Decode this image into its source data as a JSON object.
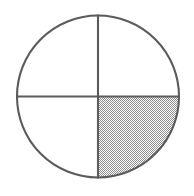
{
  "figure": {
    "kind": "fraction-circle-diagram",
    "background_color": "#ffffff",
    "canvas": {
      "width": 194,
      "height": 196
    }
  },
  "circle": {
    "center_x": 98,
    "center_y": 96.5,
    "radius": 82,
    "stroke_color": "#5b5b5b",
    "stroke_width": 2.1,
    "fill_color": "#ffffff"
  },
  "dividers": [
    {
      "name": "vertical-diameter",
      "orientation": "vertical",
      "x1": 98,
      "y1": 14.5,
      "x2": 98,
      "y2": 178.5,
      "stroke_color": "#5b5b5b",
      "stroke_width": 2.1
    },
    {
      "name": "horizontal-diameter",
      "orientation": "horizontal",
      "x1": 16,
      "y1": 96.5,
      "x2": 180,
      "y2": 96.5,
      "stroke_color": "#5b5b5b",
      "stroke_width": 2.1
    }
  ],
  "sectors": [
    {
      "name": "top-left-quadrant",
      "position": "top-left",
      "index": 0,
      "shaded": false,
      "fill": "#ffffff",
      "start_angle_deg": 180,
      "end_angle_deg": 270
    },
    {
      "name": "top-right-quadrant",
      "position": "top-right",
      "index": 1,
      "shaded": false,
      "fill": "#ffffff",
      "start_angle_deg": 270,
      "end_angle_deg": 360
    },
    {
      "name": "bottom-right-quadrant",
      "position": "bottom-right",
      "index": 2,
      "shaded": true,
      "fill": "halftone-50-gray",
      "start_angle_deg": 0,
      "end_angle_deg": 90
    },
    {
      "name": "bottom-left-quadrant",
      "position": "bottom-left",
      "index": 3,
      "shaded": false,
      "fill": "#ffffff",
      "start_angle_deg": 90,
      "end_angle_deg": 180
    }
  ],
  "shading": {
    "pattern": "checkerboard-dither",
    "dot_color": "#8f8f8f",
    "gap_color": "#ffffff",
    "cell_size": 2,
    "effective_gray": "#b4b4b4",
    "coverage_fraction": "1/4",
    "shaded_parts": 1,
    "total_parts": 4
  },
  "chart_data": {
    "type": "pie",
    "title": "",
    "categories": [
      "shaded",
      "unshaded",
      "unshaded",
      "unshaded"
    ],
    "values": [
      25,
      25,
      25,
      25
    ],
    "labels": [
      "bottom-right",
      "bottom-left",
      "top-left",
      "top-right"
    ],
    "colors": [
      "#b4b4b4",
      "#ffffff",
      "#ffffff",
      "#ffffff"
    ],
    "legend": false,
    "grid": false,
    "xlabel": "",
    "ylabel": ""
  }
}
